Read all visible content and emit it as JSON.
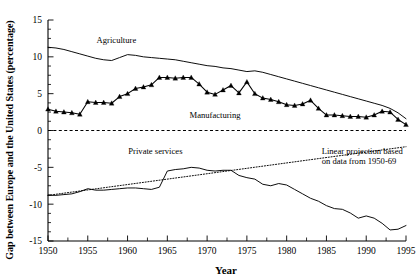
{
  "chart_data": {
    "type": "line",
    "title": "",
    "xlabel": "Year",
    "ylabel": "Gap between Europe and the United States (percentage)",
    "xlim": [
      1950,
      1995
    ],
    "ylim": [
      -15,
      15
    ],
    "grid": false,
    "legend_position": "inline-annotations",
    "x_ticks": [
      1950,
      1955,
      1960,
      1965,
      1970,
      1975,
      1980,
      1985,
      1990,
      1995
    ],
    "x_tick_labels": [
      "1950",
      "1955",
      "1960",
      "1965",
      "1970",
      "1975",
      "1980",
      "1985",
      "1990",
      "1995"
    ],
    "x_minor_step": 2.5,
    "y_ticks": [
      -15,
      -10,
      -5,
      0,
      5,
      10,
      15
    ],
    "y_tick_labels": [
      "-15",
      "-10",
      "-5",
      "0",
      "5",
      "10",
      "15"
    ],
    "y_minor_step": 1.25,
    "zero_line": 0,
    "annotations": [
      {
        "text": "Agriculture",
        "x": 1958.6,
        "y": 11.9,
        "anchor": "middle"
      },
      {
        "text": "Manufacturing",
        "x": 1971.0,
        "y": 1.75,
        "anchor": "middle"
      },
      {
        "text": "Private services",
        "x": 1963.5,
        "y": -3.2,
        "anchor": "middle"
      },
      {
        "text": "Linear projection based",
        "x": 1984.4,
        "y": -3.15,
        "anchor": "start"
      },
      {
        "text": "on data from 1950-69",
        "x": 1984.4,
        "y": -4.55,
        "anchor": "start"
      }
    ],
    "series": [
      {
        "name": "Agriculture",
        "style": "solid",
        "marker": "none",
        "x": [
          1950,
          1951,
          1952,
          1953,
          1954,
          1955,
          1956,
          1957,
          1958,
          1959,
          1960,
          1961,
          1962,
          1963,
          1964,
          1965,
          1966,
          1967,
          1968,
          1969,
          1970,
          1971,
          1972,
          1973,
          1974,
          1975,
          1976,
          1977,
          1978,
          1979,
          1980,
          1981,
          1982,
          1983,
          1984,
          1985,
          1986,
          1987,
          1988,
          1989,
          1990,
          1991,
          1992,
          1993,
          1994,
          1995
        ],
        "values": [
          11.3,
          11.2,
          11.0,
          10.7,
          10.4,
          10.1,
          9.8,
          9.6,
          9.5,
          9.9,
          10.3,
          10.2,
          10.0,
          9.9,
          9.8,
          9.7,
          9.6,
          9.4,
          9.2,
          9.0,
          8.8,
          8.7,
          8.5,
          8.4,
          8.2,
          8.0,
          8.1,
          7.9,
          7.6,
          7.3,
          7.0,
          6.7,
          6.4,
          6.1,
          5.8,
          5.5,
          5.2,
          4.9,
          4.6,
          4.3,
          4.0,
          3.7,
          3.4,
          3.0,
          2.4,
          1.6
        ]
      },
      {
        "name": "Manufacturing",
        "style": "solid",
        "marker": "triangle",
        "x": [
          1950,
          1951,
          1952,
          1953,
          1954,
          1955,
          1956,
          1957,
          1958,
          1959,
          1960,
          1961,
          1962,
          1963,
          1964,
          1965,
          1966,
          1967,
          1968,
          1969,
          1970,
          1971,
          1972,
          1973,
          1974,
          1975,
          1976,
          1977,
          1978,
          1979,
          1980,
          1981,
          1982,
          1983,
          1984,
          1985,
          1986,
          1987,
          1988,
          1989,
          1990,
          1991,
          1992,
          1993,
          1994,
          1995
        ],
        "values": [
          2.9,
          2.6,
          2.5,
          2.4,
          2.2,
          3.9,
          3.8,
          3.8,
          3.7,
          4.6,
          5.0,
          5.7,
          5.9,
          6.2,
          7.2,
          7.2,
          7.1,
          7.2,
          7.2,
          6.3,
          5.2,
          4.9,
          5.5,
          6.1,
          5.1,
          6.6,
          5.0,
          4.4,
          4.2,
          3.9,
          3.5,
          3.4,
          3.6,
          4.1,
          3.0,
          2.1,
          2.1,
          2.0,
          1.9,
          1.9,
          1.8,
          2.1,
          2.6,
          2.5,
          1.5,
          0.8
        ]
      },
      {
        "name": "Private services",
        "style": "solid",
        "marker": "none",
        "x": [
          1950,
          1951,
          1952,
          1953,
          1954,
          1955,
          1956,
          1957,
          1958,
          1959,
          1960,
          1961,
          1962,
          1963,
          1964,
          1965,
          1966,
          1967,
          1968,
          1969,
          1970,
          1971,
          1972,
          1973,
          1974,
          1975,
          1976,
          1977,
          1978,
          1979,
          1980,
          1981,
          1982,
          1983,
          1984,
          1985,
          1986,
          1987,
          1988,
          1989,
          1990,
          1991,
          1992,
          1993,
          1994,
          1995
        ],
        "values": [
          -8.8,
          -8.8,
          -8.7,
          -8.6,
          -8.3,
          -7.9,
          -8.1,
          -8.1,
          -8.0,
          -7.9,
          -7.8,
          -7.8,
          -7.9,
          -8.0,
          -7.7,
          -5.5,
          -5.3,
          -5.2,
          -5.0,
          -5.1,
          -5.4,
          -5.5,
          -5.4,
          -5.4,
          -6.1,
          -6.4,
          -6.6,
          -7.3,
          -7.5,
          -7.2,
          -7.4,
          -8.0,
          -8.6,
          -9.2,
          -9.6,
          -10.2,
          -10.6,
          -10.7,
          -11.2,
          -11.9,
          -11.6,
          -11.9,
          -12.6,
          -13.5,
          -13.4,
          -12.9
        ]
      },
      {
        "name": "Linear projection based on data from 1950-69",
        "style": "dotted",
        "marker": "none",
        "x": [
          1950,
          1995
        ],
        "values": [
          -8.8,
          -2.2
        ]
      }
    ]
  }
}
